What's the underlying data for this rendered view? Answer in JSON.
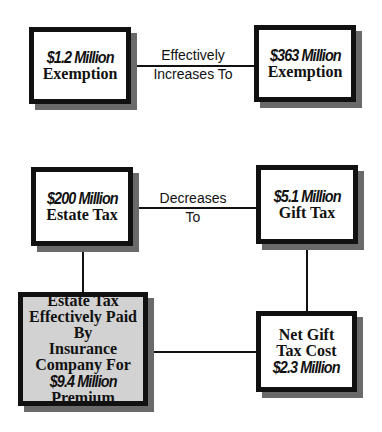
{
  "top_row": {
    "left_box": {
      "amount": "$1.2 Million",
      "label": "Exemption"
    },
    "connector_label_line1": "Effectively",
    "connector_label_line2": "Increases To",
    "right_box": {
      "amount": "$363 Million",
      "label": "Exemption"
    }
  },
  "middle_row": {
    "left_box": {
      "amount": "$200 Million",
      "label": "Estate Tax"
    },
    "connector_label_line1": "Decreases",
    "connector_label_line2": "To",
    "right_box": {
      "amount": "$5.1 Million",
      "label": "Gift Tax"
    }
  },
  "bottom_row": {
    "left_box": {
      "line1": "Estate Tax",
      "line2": "Effectively Paid By",
      "line3": "Insurance",
      "line4": "Company For",
      "amount": "$9.4 Million",
      "line6": "Premium"
    },
    "right_box": {
      "line1": "Net Gift",
      "line2": "Tax Cost",
      "amount": "$2.3 Million"
    }
  },
  "colors": {
    "border": "#111111",
    "shadow": "#6a6a6a",
    "highlight_fill": "#d2d2d2",
    "background": "#ffffff"
  }
}
